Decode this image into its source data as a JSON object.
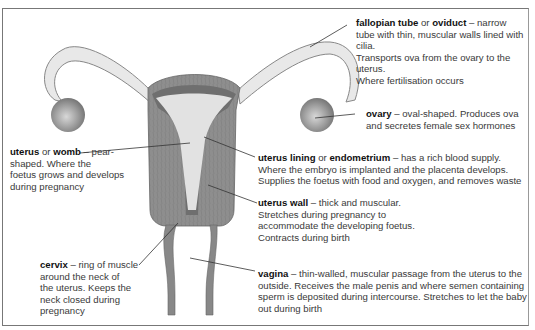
{
  "diagram": {
    "colors": {
      "wall": "#8c8c8c",
      "lining": "#6e6e6e",
      "cavity": "#e2e2e2",
      "tube": "#e6e6e6",
      "tube_outline": "#8a8a8a",
      "ovary": "#9a9a9a",
      "text": "#333333",
      "border": "#777777"
    },
    "labels": {
      "fallopian": {
        "term1": "fallopian tube",
        "or": " or ",
        "term2": "oviduct",
        "desc_lead": " – narrow",
        "lines": [
          "tube with thin, muscular walls lined with cilia.",
          "Transports ova from the ovary to the uterus.",
          "Where fertilisation occurs"
        ]
      },
      "ovary": {
        "term1": "ovary",
        "desc_lead": " – oval-shaped. Produces ova",
        "lines": [
          "and secretes female sex hormones"
        ]
      },
      "uterus": {
        "term1": "uterus",
        "or": " or ",
        "term2": "womb",
        "desc_lead": " – pear-",
        "lines": [
          "shaped. Where the",
          "foetus grows and develops",
          "during pregnancy"
        ]
      },
      "lining": {
        "term1": "uterus lining",
        "or": " or ",
        "term2": "endometrium",
        "desc_lead": " – has a rich blood supply.",
        "lines": [
          "Where the embryo is implanted and the placenta develops.",
          "Supplies the foetus with food and oxygen, and removes waste"
        ]
      },
      "wall": {
        "term1": "uterus wall",
        "desc_lead": " – thick and muscular.",
        "lines": [
          "Stretches during pregnancy to",
          "accommodate the developing foetus.",
          "Contracts during birth"
        ]
      },
      "cervix": {
        "term1": "cervix",
        "desc_lead": " – ring of muscle",
        "lines": [
          "around the neck of",
          "the uterus. Keeps the",
          "neck closed during",
          "pregnancy"
        ]
      },
      "vagina": {
        "term1": "vagina",
        "desc_lead": " – thin-walled, muscular passage from the uterus to the",
        "lines": [
          "outside. Receives the male penis and where semen containing",
          "sperm is deposited during intercourse. Stretches to let the baby",
          "out during birth"
        ]
      }
    }
  }
}
